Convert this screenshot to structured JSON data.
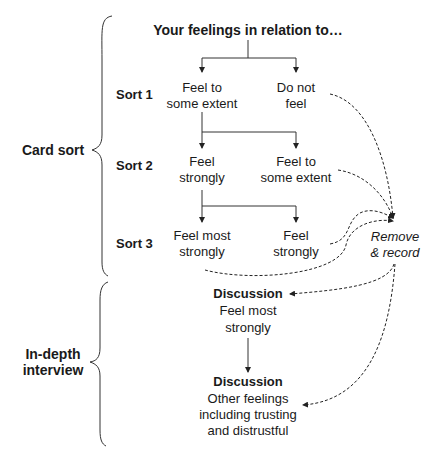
{
  "title": "Your feelings in relation to…",
  "phases": {
    "card_sort": "Card sort",
    "interview_line1": "In-depth",
    "interview_line2": "interview"
  },
  "sorts": [
    {
      "label": "Sort 1",
      "left": [
        "Feel to",
        "some extent"
      ],
      "right": [
        "Do not",
        "feel"
      ]
    },
    {
      "label": "Sort 2",
      "left": [
        "Feel",
        "strongly"
      ],
      "right": [
        "Feel to",
        "some extent"
      ]
    },
    {
      "label": "Sort 3",
      "left": [
        "Feel most",
        "strongly"
      ],
      "right": [
        "Feel",
        "strongly"
      ]
    }
  ],
  "remove": [
    "Remove",
    "& record"
  ],
  "discussions": [
    {
      "heading": "Discussion",
      "lines": [
        "Feel most",
        "strongly"
      ]
    },
    {
      "heading": "Discussion",
      "lines": [
        "Other feelings",
        "including trusting",
        "and distrustful"
      ]
    }
  ]
}
